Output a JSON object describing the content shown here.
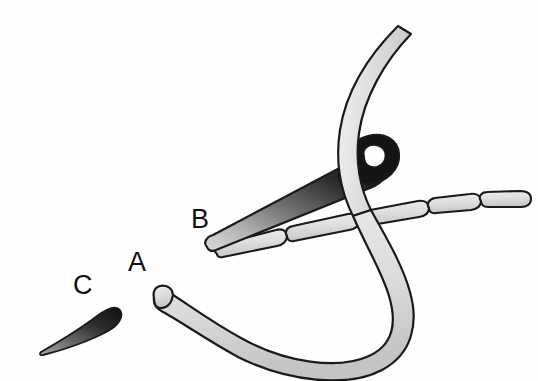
{
  "figure": {
    "kind": "line-drawing",
    "background_color": "#fefefe",
    "outline_color": "#1a1a1a",
    "labels": [
      {
        "id": "a",
        "text": "A",
        "x": 128,
        "y": 249,
        "points_to": "thread-free-end"
      },
      {
        "id": "b",
        "text": "B",
        "x": 191,
        "y": 206,
        "points_to": "needle-body"
      },
      {
        "id": "c",
        "text": "C",
        "x": 73,
        "y": 272,
        "points_to": "detached-thorn"
      }
    ],
    "parts": [
      {
        "name": "thread-loop",
        "description": "Long pale band curving from upper right, down through the needle eye and around in a wide U to a rounded free end at lower left",
        "fill_light": "#e6e6e6",
        "fill_dark": "#c9c9c9",
        "stroke": "#1a1a1a"
      },
      {
        "name": "needle-body",
        "description": "Tapered dark wedge with a rounded eye at its thick upper-right end and a blunt rounded point at lower left",
        "fill_dark": "#141414",
        "fill_light": "#cfcfcf",
        "stroke": "#1a1a1a"
      },
      {
        "name": "segment-chain",
        "description": "Chain of five pale capsule-shaped segments running from lower left to upper right",
        "segment_count": 5,
        "fill": "#dcdcdc",
        "stroke": "#1a1a1a"
      },
      {
        "name": "detached-thorn",
        "description": "Small dark teardrop / thorn shape isolated at lower left",
        "fill_dark": "#1c1c1c",
        "fill_light": "#8d8d8d",
        "stroke": "#1a1a1a"
      }
    ],
    "palette": {
      "background": "#fefefe",
      "ink": "#1a1a1a",
      "pale_fill": "#e2e2e2",
      "mid_fill": "#bdbdbd",
      "dark_fill": "#161616",
      "label_color": "#101010"
    }
  }
}
